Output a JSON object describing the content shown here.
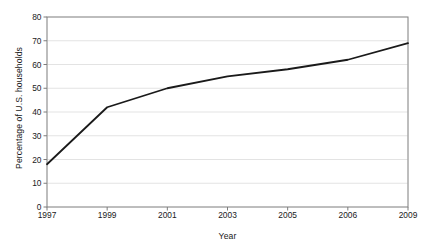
{
  "chart_data": {
    "type": "line",
    "title": "",
    "xlabel": "Year",
    "ylabel": "Percentage of U.S. households",
    "categories": [
      "1997",
      "1999",
      "2001",
      "2003",
      "2005",
      "2006",
      "2009"
    ],
    "values": [
      18,
      42,
      50,
      55,
      58,
      62,
      69
    ],
    "series": [
      {
        "name": "Percentage of U.S. households",
        "values": [
          18,
          42,
          50,
          55,
          58,
          62,
          69
        ]
      }
    ],
    "ylim": [
      0,
      80
    ],
    "ytick_values": [
      0,
      10,
      20,
      30,
      40,
      50,
      60,
      70,
      80
    ],
    "ytick_labels": [
      "0",
      "10",
      "20",
      "30",
      "40",
      "50",
      "60",
      "70",
      "80"
    ],
    "xtick_labels": [
      "1997",
      "1999",
      "2001",
      "2003",
      "2005",
      "2006",
      "2009"
    ],
    "grid": "horizontal",
    "legend": "none",
    "line_color": "#1a1a1a",
    "grid_color": "#e3e3e3",
    "axis_color": "#7d7d7d",
    "background_color": "#ffffff"
  }
}
